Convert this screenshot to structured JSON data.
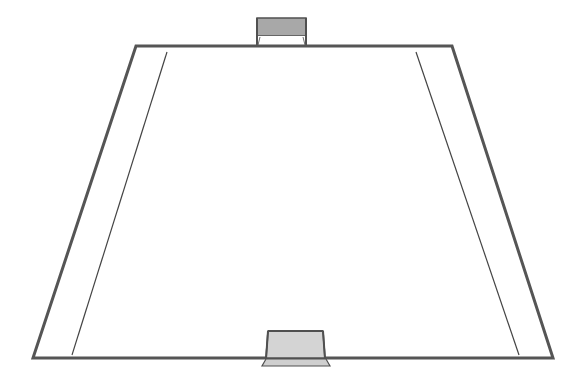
{
  "diagram": {
    "type": "perspective-field",
    "colors": {
      "background": "#ffffff",
      "outline": "#555555",
      "inner_line": "#444444",
      "goal_fill": "#a8a8a8",
      "goal_fill_near": "#d4d4d4",
      "goal_frame": "#505050"
    },
    "field": {
      "top_left": [
        136,
        46
      ],
      "top_right": [
        452,
        46
      ],
      "bottom_right": [
        553,
        358
      ],
      "bottom_left": [
        33,
        358
      ]
    },
    "inner_lines": {
      "left": {
        "top": [
          167,
          52
        ],
        "bottom": [
          72,
          355
        ]
      },
      "right": {
        "top": [
          416,
          52
        ],
        "bottom": [
          519,
          355
        ]
      }
    },
    "goals": {
      "far": {
        "label": "far-goal",
        "x": 257,
        "y": 18,
        "width": 49,
        "height": 18,
        "base_y": 45
      },
      "near": {
        "label": "near-goal",
        "x": 267,
        "y": 331,
        "width": 58,
        "height": 28,
        "base_y": 366
      }
    }
  }
}
